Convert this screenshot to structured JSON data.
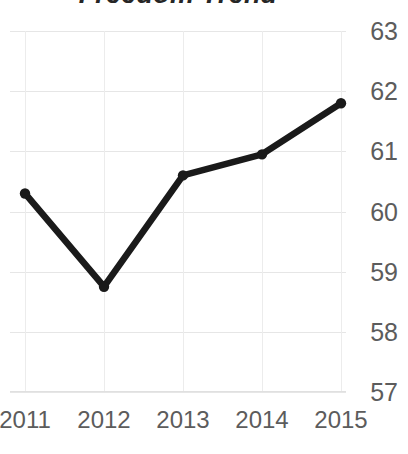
{
  "chart_data": {
    "type": "line",
    "title": "Freedom Trend",
    "xlabel": "",
    "ylabel": "",
    "categories": [
      "2011",
      "2012",
      "2013",
      "2014",
      "2015"
    ],
    "values": [
      60.3,
      58.75,
      60.6,
      60.95,
      61.8
    ],
    "series": [
      {
        "name": "Freedom score",
        "values": [
          60.3,
          58.75,
          60.6,
          60.95,
          61.8
        ]
      }
    ],
    "ylim": [
      57,
      63
    ],
    "yticks": [
      "63",
      "62",
      "61",
      "60",
      "59",
      "58",
      "57"
    ],
    "ytick_values": [
      63,
      62,
      61,
      60,
      59,
      58,
      57
    ],
    "xticks": [
      "2011",
      "2012",
      "2013",
      "2014",
      "2015"
    ],
    "grid": true,
    "grid_axis": "both",
    "legend": false,
    "legend_position": "none",
    "y_axis_side": "right",
    "markers": true,
    "annotations": [],
    "colors": {
      "line": "#1a1a1a",
      "marker": "#1a1a1a",
      "grid": "#e6e6e6",
      "tick_label": "#5c5c5c",
      "title": "#262626",
      "background": "#ffffff"
    }
  }
}
